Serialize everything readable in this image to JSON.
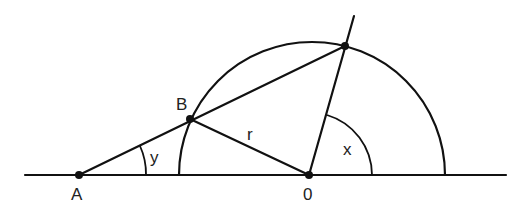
{
  "diagram": {
    "type": "geometry",
    "points": {
      "A": {
        "label": "A",
        "x": 79,
        "y": 175
      },
      "B": {
        "label": "B",
        "x": 190,
        "y": 119
      },
      "O": {
        "label": "0",
        "x": 309,
        "y": 175
      },
      "P": {
        "label": "",
        "x": 345,
        "y": 46
      }
    },
    "labels": {
      "radius": "r",
      "angle_at_A": "y",
      "angle_at_O": "x"
    },
    "colors": {
      "line": "#111111",
      "background": "#ffffff"
    }
  }
}
